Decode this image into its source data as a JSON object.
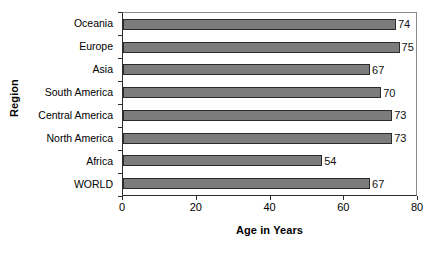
{
  "chart_data": {
    "type": "bar",
    "orientation": "horizontal",
    "title": "",
    "xlabel": "Age in Years",
    "ylabel": "Region",
    "xlim": [
      0,
      80
    ],
    "ylim": null,
    "grid": false,
    "legend": null,
    "xticks": [
      "0",
      "20",
      "40",
      "60",
      "80"
    ],
    "xtick_values": [
      0,
      20,
      40,
      60,
      80
    ],
    "categories": [
      "Oceania",
      "Europe",
      "Asia",
      "South America",
      "Central America",
      "North America",
      "Africa",
      "WORLD"
    ],
    "values": [
      74,
      75,
      67,
      70,
      73,
      73,
      54,
      67
    ],
    "data_labels": [
      "74",
      "75",
      "67",
      "70",
      "73",
      "73",
      "54",
      "67"
    ],
    "bar_color": "#7c7c7c",
    "bar_edge_color": "#2b2b2b",
    "axis_color": "#2b2b2b",
    "background_color": "#ffffff"
  }
}
